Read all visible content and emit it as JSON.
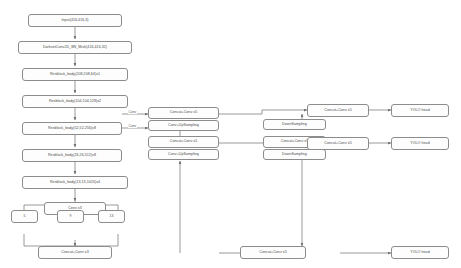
{
  "diagram": {
    "background_color": "#ffffff",
    "box_fill": "#fdfdfd",
    "box_stroke": "#8c8c8c",
    "text_color": "#4a4a4a",
    "backbone": [
      {
        "id": "input",
        "label": "Input(416,416,3)"
      },
      {
        "id": "stem",
        "label": "DarknetConv2D_BN_Mish(416,416,32)"
      },
      {
        "id": "res1",
        "label": "Resblock_body(208,208,64)x1"
      },
      {
        "id": "res2",
        "label": "Resblock_body(104,104,128)x2"
      },
      {
        "id": "res3",
        "label": "Resblock_body(52,52,256)x8"
      },
      {
        "id": "res4",
        "label": "Resblock_body(26,26,512)x8"
      },
      {
        "id": "res5",
        "label": "Resblock_body(13,13,1024)x4"
      },
      {
        "id": "conv3",
        "label": "Conv x3"
      }
    ],
    "spp": {
      "pools": [
        {
          "id": "pool5",
          "label": "5"
        },
        {
          "id": "pool9",
          "label": "9"
        },
        {
          "id": "pool13",
          "label": "13"
        }
      ],
      "merge": {
        "id": "spp_concat",
        "label": "Concat+Conv x3"
      }
    },
    "neck": [
      {
        "id": "panet_top",
        "label": "Concat+Conv x5"
      },
      {
        "id": "up1",
        "label": "Conv+UpSampling"
      },
      {
        "id": "panet_mid",
        "label": "Concat+Conv x5"
      },
      {
        "id": "up2",
        "label": "Conv+UpSampling"
      },
      {
        "id": "down1",
        "label": "DownSampling"
      },
      {
        "id": "panet_mid2",
        "label": "Concat+Conv x5"
      },
      {
        "id": "down2",
        "label": "DownSampling"
      },
      {
        "id": "out_top",
        "label": "Concat+Conv x5"
      },
      {
        "id": "out_mid",
        "label": "Concat+Conv x5"
      },
      {
        "id": "out_bot",
        "label": "Concat+Conv x5"
      }
    ],
    "heads": [
      {
        "id": "head1",
        "label": "YOLO head"
      },
      {
        "id": "head2",
        "label": "YOLO head"
      },
      {
        "id": "head3",
        "label": "YOLO head"
      }
    ],
    "edge_labels": [
      {
        "id": "conv_lbl_1",
        "label": "Conv"
      },
      {
        "id": "conv_lbl_2",
        "label": "Conv"
      }
    ]
  }
}
